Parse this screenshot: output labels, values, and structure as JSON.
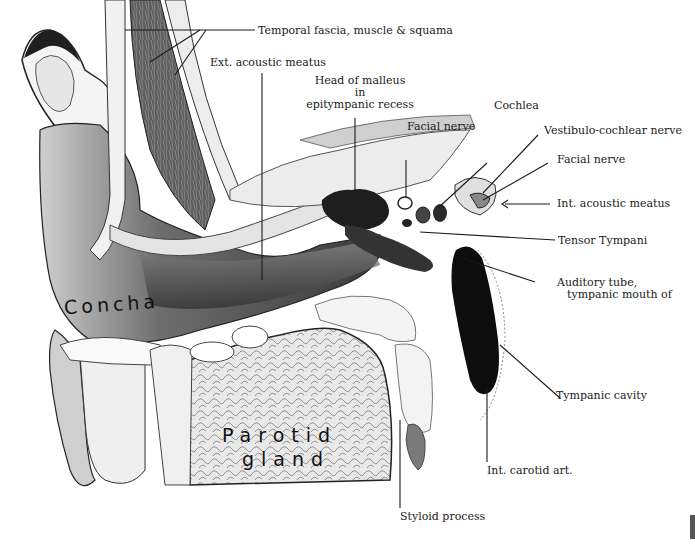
{
  "figure": {
    "type": "anatomical illustration",
    "colors": {
      "ink": "#1a1a1a",
      "dark_tissue": "#2b2b2b",
      "mid_tone": "#7a7a7a",
      "light_tone": "#d9d9d9",
      "background": "#ffffff"
    }
  },
  "labels": {
    "temporal": "Temporal fascia, muscle & squama",
    "ext_meatus": "Ext. acoustic meatus",
    "malleus_1": "Head of malleus",
    "malleus_2": "in",
    "malleus_3": "epitympanic recess",
    "facial_nerve_1": "Facial nerve",
    "cochlea": "Cochlea",
    "vestibulo": "Vestibulo-cochlear nerve",
    "facial_nerve_2": "Facial nerve",
    "int_meatus": "Int. acoustic meatus",
    "tensor": "Tensor Tympani",
    "auditory_1": "Auditory tube,",
    "auditory_2": "tympanic mouth of",
    "tympanic_cavity": "Tympanic cavity",
    "carotid": "Int. carotid art.",
    "styloid": "Styloid process"
  },
  "handwritten": {
    "concha": "Concha",
    "parotid_1": "Parotid",
    "parotid_2": "gland"
  }
}
